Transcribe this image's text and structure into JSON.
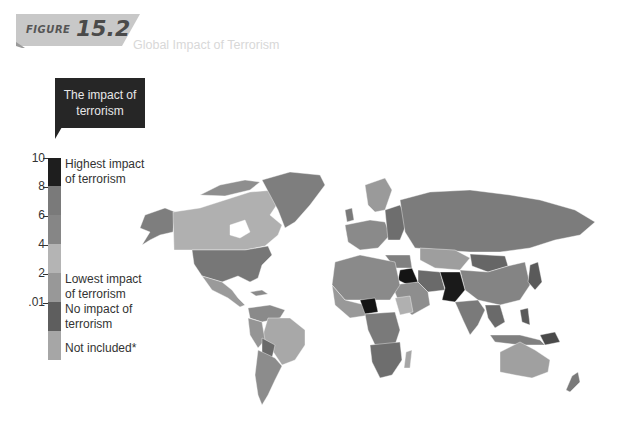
{
  "header": {
    "figure_label": "FIGURE",
    "figure_number": "15.2",
    "title": "Global Impact of Terrorism"
  },
  "legend": {
    "callout": "The impact of terrorism",
    "ticks": [
      "10",
      "8",
      "6",
      "4",
      "2",
      ".01"
    ],
    "labels": {
      "highest": "Highest impact of terrorism",
      "lowest": "Lowest impact of terrorism",
      "none": "No impact of terrorism",
      "not_included": "Not included*"
    },
    "bands": [
      {
        "range": "8-10",
        "color": "#1e1e1e"
      },
      {
        "range": "6-8",
        "color": "#7a7a7a"
      },
      {
        "range": "4-6",
        "color": "#858585"
      },
      {
        "range": "2-4",
        "color": "#b4b4b4"
      },
      {
        "range": ".01-2",
        "color": "#9a9a9a"
      },
      {
        "range": "0",
        "color": "#5e5e5e"
      },
      {
        "range": "n/a",
        "color": "#a6a6a6"
      }
    ]
  },
  "map": {
    "description": "World choropleth map of terrorism impact (grayscale)",
    "highest_impact_regions": [
      "Iraq",
      "Afghanistan",
      "Pakistan",
      "Nigeria"
    ]
  }
}
